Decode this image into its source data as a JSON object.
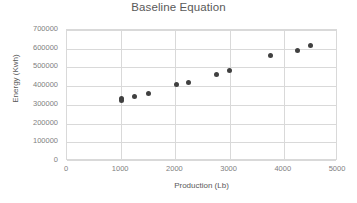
{
  "chart_data": {
    "type": "scatter",
    "title": "Baseline Equation",
    "xlabel": "Production (Lb)",
    "ylabel": "Energy (Kwh)",
    "xlim": [
      0,
      5000
    ],
    "ylim": [
      0,
      700000
    ],
    "xticks": [
      0,
      1000,
      2000,
      3000,
      4000,
      5000
    ],
    "xtick_labels": [
      "0",
      "1000",
      "2000",
      "3000",
      "4000",
      "5000"
    ],
    "yticks": [
      0,
      100000,
      200000,
      300000,
      400000,
      500000,
      600000,
      700000
    ],
    "ytick_labels": [
      "0",
      "100000",
      "200000",
      "300000",
      "400000",
      "500000",
      "600000",
      "700000"
    ],
    "grid": "horizontal-and-vertical",
    "legend": "none",
    "marker_color": "#404040",
    "series": [
      {
        "name": "Baseline",
        "points": [
          {
            "x": 1000,
            "y": 322000
          },
          {
            "x": 1010,
            "y": 336000
          },
          {
            "x": 1250,
            "y": 345000
          },
          {
            "x": 1510,
            "y": 361000
          },
          {
            "x": 2020,
            "y": 407000
          },
          {
            "x": 2240,
            "y": 420000
          },
          {
            "x": 2750,
            "y": 460000
          },
          {
            "x": 3000,
            "y": 484000
          },
          {
            "x": 3760,
            "y": 563000
          },
          {
            "x": 4250,
            "y": 588000
          },
          {
            "x": 4500,
            "y": 618000
          }
        ]
      }
    ]
  },
  "colors": {
    "title_text": "#595959",
    "tick_text": "#808080",
    "gridline": "#d9d9d9",
    "plot_background": "#ffffff",
    "marker": "#404040"
  }
}
